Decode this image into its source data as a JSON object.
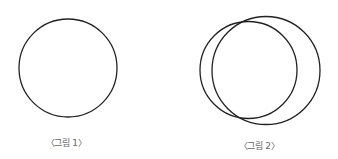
{
  "figures": [
    {
      "label": "〈그림 1〉",
      "label_pos": {
        "x": 66,
        "y": 136
      },
      "circles": [
        {
          "cx": 68,
          "cy": 68,
          "r": 49
        }
      ]
    },
    {
      "label": "〈그림 2〉",
      "label_pos": {
        "x": 259,
        "y": 139
      },
      "circles": [
        {
          "cx": 248.5,
          "cy": 70,
          "r": 48.5
        },
        {
          "cx": 266,
          "cy": 70.5,
          "r": 54
        }
      ]
    }
  ],
  "colors": {
    "stroke": "#222222",
    "label": "#666666"
  }
}
